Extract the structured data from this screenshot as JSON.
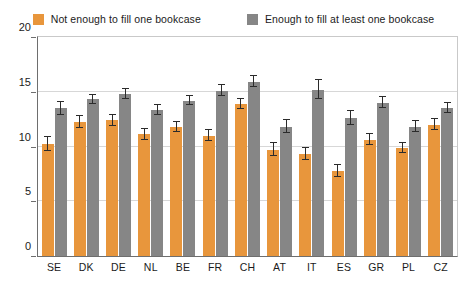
{
  "chart_data": {
    "type": "bar",
    "title": "",
    "subtitle": "",
    "xlabel": "",
    "ylabel": "",
    "ylim": [
      0,
      20
    ],
    "yticks": [
      0,
      5,
      10,
      15,
      20
    ],
    "ytick_labels": [
      "0",
      "5",
      "10",
      "15",
      "20"
    ],
    "grid": true,
    "legend_position": "top-center",
    "orientation": "vertical",
    "error_bars": true,
    "categories": [
      "SE",
      "DK",
      "DE",
      "NL",
      "BE",
      "FR",
      "CH",
      "AT",
      "IT",
      "ES",
      "GR",
      "PL",
      "CZ"
    ],
    "series": [
      {
        "name": "Not enough to fill one bookcase",
        "color": "#E8963C",
        "values": [
          10.2,
          12.2,
          12.4,
          11.1,
          11.8,
          11.0,
          13.9,
          9.7,
          9.3,
          7.8,
          10.6,
          9.9,
          12.0
        ],
        "errors": [
          0.65,
          0.55,
          0.5,
          0.5,
          0.45,
          0.5,
          0.45,
          0.6,
          0.55,
          0.55,
          0.5,
          0.45,
          0.5
        ]
      },
      {
        "name": "Enough to fill at least one bookcase",
        "color": "#868686",
        "values": [
          13.5,
          14.3,
          14.8,
          13.3,
          14.2,
          15.1,
          15.9,
          11.8,
          15.2,
          12.6,
          14.0,
          11.8,
          13.5
        ],
        "errors": [
          0.6,
          0.45,
          0.45,
          0.45,
          0.45,
          0.5,
          0.5,
          0.6,
          0.9,
          0.6,
          0.5,
          0.5,
          0.45
        ]
      }
    ]
  },
  "legend": {
    "items": [
      {
        "label": "Not enough to fill one bookcase",
        "color": "#E8963C"
      },
      {
        "label": "Enough to fill at least one bookcase",
        "color": "#868686"
      }
    ]
  },
  "axes": {
    "y": {
      "ticks": [
        "20",
        "15",
        "10",
        "5",
        "0"
      ]
    },
    "x": {
      "ticks": [
        "SE",
        "DK",
        "DE",
        "NL",
        "BE",
        "FR",
        "CH",
        "AT",
        "IT",
        "ES",
        "GR",
        "PL",
        "CZ"
      ]
    }
  },
  "colors": {
    "series_orange": "#E8963C",
    "series_gray": "#868686",
    "gridline": "#d7d7d7",
    "axis": "#6e6e6e",
    "error_bar": "#2b2b2b",
    "background": "#ffffff"
  }
}
